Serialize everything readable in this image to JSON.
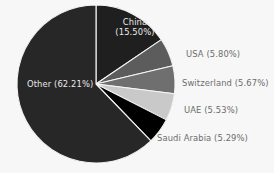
{
  "chart_data": {
    "type": "pie",
    "title": "",
    "categories": [
      "China",
      "USA",
      "Switzerland",
      "UAE",
      "Saudi Arabia",
      "Other"
    ],
    "values": [
      15.5,
      5.8,
      5.67,
      5.53,
      5.29,
      62.21
    ],
    "unit": "%",
    "start_angle_deg": 0,
    "direction": "clockwise",
    "legend": "none",
    "labels": [
      {
        "name": "China",
        "value": 15.5,
        "text_line1": "China",
        "text_line2": "(15.50%)",
        "full_text": "China (15.50%)",
        "color": "#1f1f1f",
        "text_color": "#e9e9e9",
        "placement": "inside"
      },
      {
        "name": "USA",
        "value": 5.8,
        "full_text": "USA (5.80%)",
        "color": "#5c5c5c",
        "text_color": "#6d6d6d",
        "placement": "outside"
      },
      {
        "name": "Switzerland",
        "value": 5.67,
        "full_text": "Switzerland (5.67%)",
        "color": "#6f6f6f",
        "text_color": "#6d6d6d",
        "placement": "outside"
      },
      {
        "name": "UAE",
        "value": 5.53,
        "full_text": "UAE (5.53%)",
        "color": "#c9c9c9",
        "text_color": "#6d6d6d",
        "placement": "outside"
      },
      {
        "name": "Saudi Arabia",
        "value": 5.29,
        "full_text": "Saudi Arabia (5.29%)",
        "color": "#000000",
        "text_color": "#6d6d6d",
        "placement": "outside"
      },
      {
        "name": "Other",
        "value": 62.21,
        "full_text": "Other (62.21%)",
        "color": "#272727",
        "text_color": "#e9e9e9",
        "placement": "inside"
      }
    ],
    "geometry": {
      "cx": 96,
      "cy": 84,
      "r": 79,
      "separator_color": "#f7f7f7"
    },
    "background_color": "#f7f7f7"
  }
}
